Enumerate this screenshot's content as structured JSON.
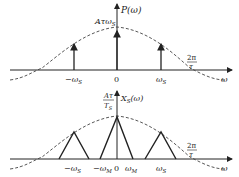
{
  "top_plot": {
    "y_axis_label": "P(ω)",
    "impulse_height_label": "Aτω",
    "impulse_height_sub": "S",
    "x_ticks": [
      {
        "label": "−ω",
        "sub": "S"
      },
      {
        "label": "0",
        "sub": ""
      },
      {
        "label": "ω",
        "sub": "S"
      }
    ],
    "zero_crossing_num": "2π",
    "zero_crossing_den": "τ",
    "x_axis_label": "ω"
  },
  "bottom_plot": {
    "y_axis_label": "X",
    "y_axis_label_sub": "S",
    "y_axis_label_tail": "(ω)",
    "peak_num": "Aτ",
    "peak_den": "T",
    "peak_den_sub": "S",
    "x_ticks": [
      {
        "label": "−ω",
        "sub": "S"
      },
      {
        "label": "−ω",
        "sub": "M"
      },
      {
        "label": "0",
        "sub": ""
      },
      {
        "label": "ω",
        "sub": "M"
      },
      {
        "label": "ω",
        "sub": "S"
      }
    ],
    "zero_crossing_num": "2π",
    "zero_crossing_den": "τ",
    "x_axis_label": "ω"
  },
  "colors": {
    "line": "#222222",
    "dashed_envelope": "#444444"
  }
}
